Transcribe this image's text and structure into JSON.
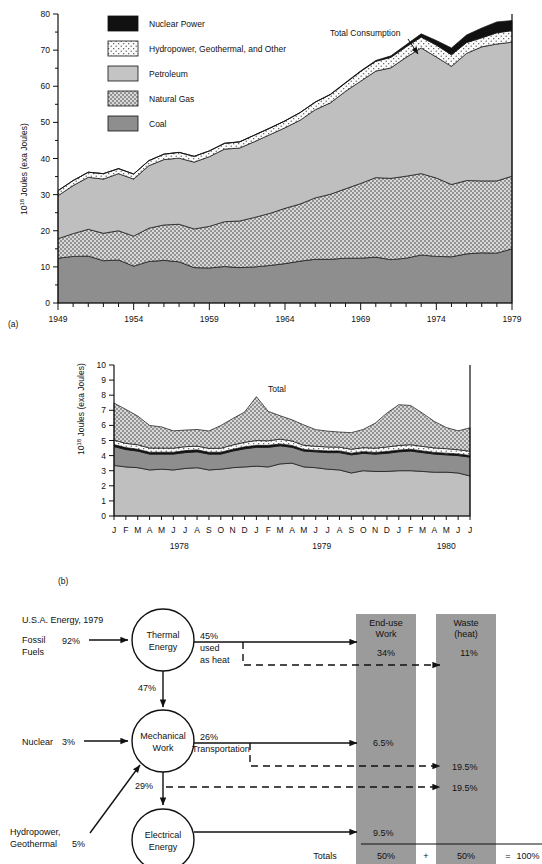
{
  "figure": {
    "panel_a_label": "(a)",
    "panel_b_label": "(b)"
  },
  "chart_data": [
    {
      "id": "panel_a",
      "type": "area",
      "stacked": true,
      "title": "",
      "xlabel": "",
      "ylabel": "10^18 Joules (exa Joules)",
      "ylabel_base": "10",
      "ylabel_exp": "18",
      "ylabel_rest": " Joules (exa Joules)",
      "ylim": [
        0,
        80
      ],
      "yticks": [
        0,
        10,
        20,
        30,
        40,
        50,
        60,
        70,
        80
      ],
      "ytick_labels": [
        "0",
        "10",
        "20",
        "30",
        "40",
        "50",
        "60",
        "70",
        "80"
      ],
      "minor_yticks": [
        5,
        15,
        25,
        35,
        45,
        55,
        65,
        75
      ],
      "xlim": [
        1949,
        1979
      ],
      "xticks": [
        1949,
        1954,
        1959,
        1964,
        1969,
        1974,
        1979
      ],
      "xtick_labels": [
        "1949",
        "1954",
        "1959",
        "1964",
        "1969",
        "1974",
        "1979"
      ],
      "grid": false,
      "annotation": "Total Consumption",
      "x": [
        1949,
        1950,
        1951,
        1952,
        1953,
        1954,
        1955,
        1956,
        1957,
        1958,
        1959,
        1960,
        1961,
        1962,
        1963,
        1964,
        1965,
        1966,
        1967,
        1968,
        1969,
        1970,
        1971,
        1972,
        1973,
        1974,
        1975,
        1976,
        1977,
        1978,
        1979
      ],
      "series": [
        {
          "name": "Coal",
          "key": "coal",
          "color": "#9a9a9a",
          "pattern": "solid-dark",
          "values": [
            12.4,
            12.9,
            13.0,
            11.7,
            11.9,
            10.2,
            11.5,
            11.8,
            11.4,
            9.8,
            9.7,
            10.1,
            9.8,
            10.0,
            10.4,
            10.9,
            11.6,
            12.1,
            12.1,
            12.4,
            12.4,
            12.7,
            12.0,
            12.4,
            13.3,
            12.9,
            12.8,
            13.6,
            13.9,
            13.8,
            15.0
          ]
        },
        {
          "name": "Natural Gas",
          "key": "gas",
          "color": "#cfcfcf",
          "pattern": "dots-dense",
          "values": [
            5.4,
            6.3,
            7.4,
            7.6,
            8.1,
            8.3,
            9.2,
            9.8,
            10.4,
            10.7,
            11.5,
            12.4,
            12.9,
            13.7,
            14.4,
            15.3,
            15.8,
            17.0,
            18.0,
            19.2,
            20.7,
            22.0,
            22.5,
            22.7,
            22.5,
            21.7,
            20.0,
            20.3,
            19.9,
            20.0,
            20.1
          ]
        },
        {
          "name": "Petroleum",
          "key": "petroleum",
          "color": "#bfbfbf",
          "pattern": "solid-light",
          "values": [
            11.9,
            13.3,
            14.4,
            15.0,
            15.8,
            15.8,
            17.3,
            18.1,
            18.3,
            18.5,
            19.3,
            20.1,
            20.2,
            21.0,
            21.8,
            22.3,
            23.2,
            24.4,
            25.3,
            27.0,
            28.3,
            29.5,
            30.6,
            32.9,
            34.8,
            33.5,
            32.7,
            35.2,
            37.1,
            37.9,
            37.1
          ]
        },
        {
          "name": "Hydropower, Geothermal, and Other",
          "key": "hydro",
          "color": "#f4f4f4",
          "pattern": "dots-sparse",
          "values": [
            1.4,
            1.4,
            1.4,
            1.5,
            1.4,
            1.4,
            1.4,
            1.5,
            1.6,
            1.6,
            1.6,
            1.6,
            1.7,
            1.8,
            1.8,
            1.9,
            2.1,
            2.1,
            2.3,
            2.3,
            2.7,
            2.7,
            2.9,
            2.9,
            3.0,
            3.3,
            3.2,
            3.0,
            2.5,
            3.1,
            3.2
          ]
        },
        {
          "name": "Nuclear Power",
          "key": "nuclear",
          "color": "#111111",
          "pattern": "solid-black",
          "values": [
            0,
            0,
            0,
            0,
            0,
            0,
            0,
            0,
            0,
            0,
            0,
            0,
            0.02,
            0.03,
            0.04,
            0.04,
            0.04,
            0.06,
            0.09,
            0.14,
            0.15,
            0.24,
            0.41,
            0.58,
            0.91,
            1.27,
            1.9,
            2.11,
            2.7,
            3.02,
            2.78
          ]
        }
      ],
      "legend": {
        "position": "top-left-inside",
        "entries": [
          {
            "label": "Nuclear Power",
            "key": "nuclear"
          },
          {
            "label": "Hydropower, Geothermal, and Other",
            "key": "hydro"
          },
          {
            "label": "Petroleum",
            "key": "petroleum"
          },
          {
            "label": "Natural Gas",
            "key": "gas"
          },
          {
            "label": "Coal",
            "key": "coal"
          }
        ]
      }
    },
    {
      "id": "panel_b",
      "type": "area",
      "stacked": true,
      "title": "",
      "xlabel": "",
      "ylabel": "10^18 Joules (exa Joules)",
      "ylabel_base": "10",
      "ylabel_exp": "18",
      "ylabel_rest": " Joules (exa Joules)",
      "ylim": [
        0,
        10
      ],
      "yticks": [
        0,
        1,
        2,
        3,
        4,
        5,
        6,
        7,
        8,
        9,
        10
      ],
      "ytick_labels": [
        "0",
        "1",
        "2",
        "3",
        "4",
        "5",
        "6",
        "7",
        "8",
        "9",
        "10"
      ],
      "grid": false,
      "annotation": "Total",
      "xtick_labels": [
        "J",
        "F",
        "M",
        "A",
        "M",
        "J",
        "J",
        "A",
        "S",
        "O",
        "N",
        "D",
        "J",
        "F",
        "M",
        "A",
        "M",
        "J",
        "J",
        "A",
        "S",
        "O",
        "N",
        "D",
        "J",
        "F",
        "M",
        "A",
        "M",
        "J",
        "J"
      ],
      "year_labels": [
        "1978",
        "1979",
        "1980"
      ],
      "series": [
        {
          "name": "Petroleum",
          "key": "petroleum",
          "color": "#bfbfbf",
          "pattern": "solid-light",
          "values": [
            3.35,
            3.25,
            3.2,
            3.05,
            3.1,
            3.05,
            3.15,
            3.2,
            3.05,
            3.1,
            3.2,
            3.25,
            3.3,
            3.25,
            3.45,
            3.5,
            3.25,
            3.2,
            3.1,
            3.05,
            2.85,
            3.0,
            2.95,
            2.95,
            3.0,
            3.0,
            2.95,
            2.9,
            2.9,
            2.85,
            2.65
          ]
        },
        {
          "name": "Coal",
          "key": "coal",
          "color": "#8e8e8e",
          "pattern": "solid-dark",
          "values": [
            1.25,
            1.15,
            1.1,
            1.05,
            1.0,
            1.05,
            1.05,
            1.05,
            1.05,
            1.0,
            1.1,
            1.2,
            1.25,
            1.3,
            1.2,
            1.05,
            1.05,
            1.05,
            1.1,
            1.15,
            1.2,
            1.15,
            1.15,
            1.2,
            1.25,
            1.3,
            1.25,
            1.2,
            1.15,
            1.15,
            1.25
          ]
        },
        {
          "name": "Nuclear Power",
          "key": "nuclear",
          "color": "#111111",
          "pattern": "solid-black",
          "values": [
            0.13,
            0.13,
            0.12,
            0.12,
            0.12,
            0.12,
            0.13,
            0.13,
            0.12,
            0.12,
            0.12,
            0.13,
            0.13,
            0.13,
            0.12,
            0.12,
            0.1,
            0.1,
            0.11,
            0.11,
            0.11,
            0.11,
            0.11,
            0.12,
            0.12,
            0.12,
            0.11,
            0.11,
            0.11,
            0.11,
            0.11
          ]
        },
        {
          "name": "Hydropower, Geothermal, and Other",
          "key": "hydro",
          "color": "#f4f4f4",
          "pattern": "dots-sparse",
          "values": [
            0.3,
            0.28,
            0.3,
            0.28,
            0.28,
            0.27,
            0.26,
            0.25,
            0.26,
            0.27,
            0.28,
            0.3,
            0.32,
            0.3,
            0.32,
            0.3,
            0.28,
            0.27,
            0.26,
            0.25,
            0.26,
            0.27,
            0.28,
            0.3,
            0.3,
            0.3,
            0.3,
            0.3,
            0.3,
            0.28,
            0.28
          ]
        },
        {
          "name": "Natural Gas",
          "key": "gas",
          "color": "#cfcfcf",
          "pattern": "dots-dense",
          "values": [
            2.45,
            2.25,
            1.9,
            1.5,
            1.4,
            1.15,
            1.1,
            1.1,
            1.15,
            1.5,
            1.75,
            2.0,
            2.9,
            1.95,
            1.55,
            1.4,
            1.35,
            1.1,
            1.05,
            1.0,
            1.1,
            1.2,
            1.65,
            2.25,
            2.7,
            2.6,
            2.2,
            1.75,
            1.4,
            1.25,
            1.55
          ]
        }
      ],
      "totals": [
        7.48,
        7.06,
        6.62,
        6.0,
        5.9,
        5.64,
        5.69,
        5.73,
        5.63,
        5.99,
        6.45,
        6.88,
        7.9,
        6.93,
        6.64,
        6.37,
        6.03,
        5.72,
        5.62,
        5.56,
        5.52,
        5.73,
        6.14,
        6.82,
        7.37,
        7.32,
        6.81,
        6.26,
        5.86,
        5.64,
        5.84
      ]
    }
  ],
  "flow_diagram": {
    "caption": "U.S.A. Energy, 1979",
    "inputs": [
      {
        "name": "Fossil Fuels",
        "line1": "Fossil",
        "line2": "Fuels",
        "value": "92%"
      },
      {
        "name": "Nuclear",
        "line1": "Nuclear",
        "line2": "",
        "value": "3%"
      },
      {
        "name": "Hydropower Geothermal",
        "line1": "Hydropower,",
        "line2": "Geothermal",
        "value": "5%"
      }
    ],
    "nodes": [
      {
        "id": "thermal",
        "line1": "Thermal",
        "line2": "Energy"
      },
      {
        "id": "mechanical",
        "line1": "Mechanical",
        "line2": "Work"
      },
      {
        "id": "electrical",
        "line1": "Electrical",
        "line2": "Energy"
      }
    ],
    "columns": [
      {
        "id": "enduse",
        "line1": "End-use",
        "line2": "Work",
        "fill": "#9b9b9b"
      },
      {
        "id": "waste",
        "line1": "Waste",
        "line2": "(heat)",
        "fill": "#9b9b9b"
      }
    ],
    "flows": [
      {
        "id": "thermal-out",
        "label": "45%",
        "sub1": "used",
        "sub2": "as heat"
      },
      {
        "id": "thermal-to-mech",
        "label": "47%"
      },
      {
        "id": "mech-out",
        "label": "26%",
        "sub1": "Transportation"
      },
      {
        "id": "mech-to-elec",
        "label": "29%"
      }
    ],
    "results": [
      {
        "id": "enduse-thermal",
        "value": "34%"
      },
      {
        "id": "waste-thermal",
        "value": "11%"
      },
      {
        "id": "enduse-mech",
        "value": "6.5%"
      },
      {
        "id": "waste-mech",
        "value": "19.5%"
      },
      {
        "id": "waste-elec",
        "value": "19.5%"
      },
      {
        "id": "enduse-elec",
        "value": "9.5%"
      }
    ],
    "totals_row": {
      "label": "Totals",
      "enduse": "50%",
      "plus": "+",
      "waste": "50%",
      "equals": "=",
      "total": "100%"
    }
  },
  "colors": {
    "nuclear": "#111111",
    "hydro": "#f4f4f4",
    "petroleum": "#bfbfbf",
    "gas": "#cfcfcf",
    "coal": "#8e8e8e",
    "diagram_band": "#9b9b9b",
    "stroke": "#111111"
  }
}
